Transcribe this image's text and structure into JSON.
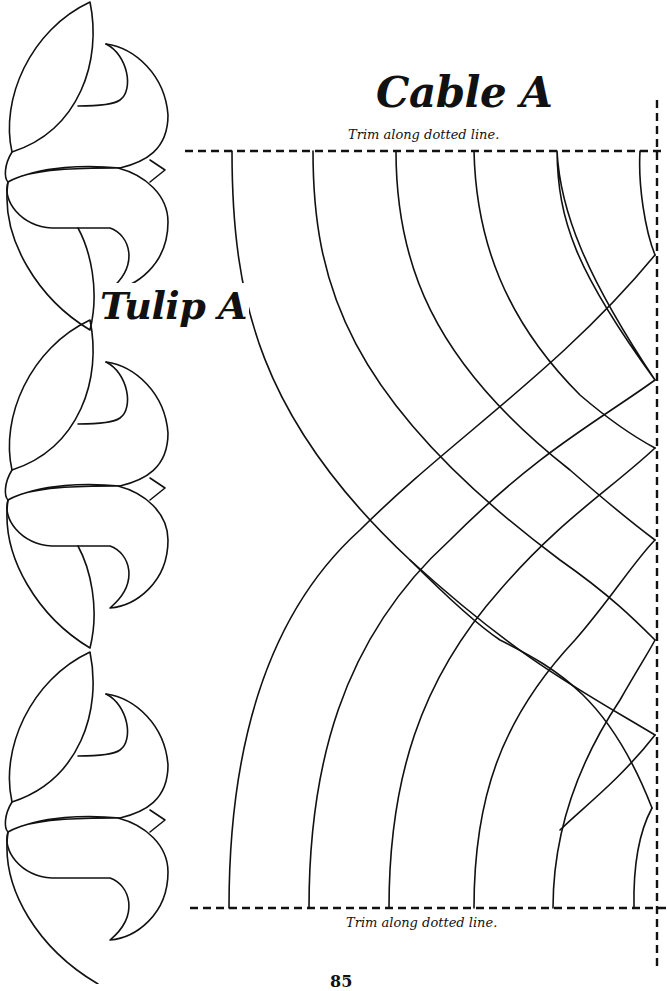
{
  "page": {
    "cable_title": "Cable A",
    "tulip_title": "Tulip A",
    "trim_top": "Trim along dotted line.",
    "trim_bottom": "Trim along dotted line.",
    "page_number": "85"
  },
  "colors": {
    "ink": "#111111",
    "paper": "#ffffff"
  },
  "patterns": [
    {
      "name": "Tulip A",
      "type": "tulip-border",
      "repeats": 3
    },
    {
      "name": "Cable A",
      "type": "cable-quarter",
      "strands": 6
    }
  ]
}
